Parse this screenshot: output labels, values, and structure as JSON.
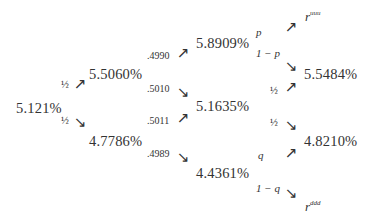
{
  "tree": {
    "root": {
      "rate": "5.121%"
    },
    "step1": {
      "up_prob": "½",
      "down_prob": "½",
      "up_rate": "5.5060%",
      "down_rate": "4.7786%"
    },
    "step2": {
      "uu_prob": ".4990",
      "ud_prob": ".5010",
      "du_prob": ".5011",
      "dd_prob": ".4989",
      "uu_rate": "5.8909%",
      "mid_rate": "5.1635%",
      "dd_rate": "4.4361%"
    },
    "step3": {
      "uuu_prob": "p",
      "uud_prob": "1 − p",
      "mid_up_prob": "½",
      "mid_down_prob": "½",
      "ddu_prob": "q",
      "ddd_prob": "1 − q",
      "uuu_rate_symbol": "r",
      "uuu_rate_superscript": "uuu",
      "uud_rate": "5.5484%",
      "udd_rate": "4.8210%",
      "ddd_rate_symbol": "r",
      "ddd_rate_superscript": "ddd"
    },
    "arrows": {
      "up": "↗",
      "down": "↘"
    }
  }
}
